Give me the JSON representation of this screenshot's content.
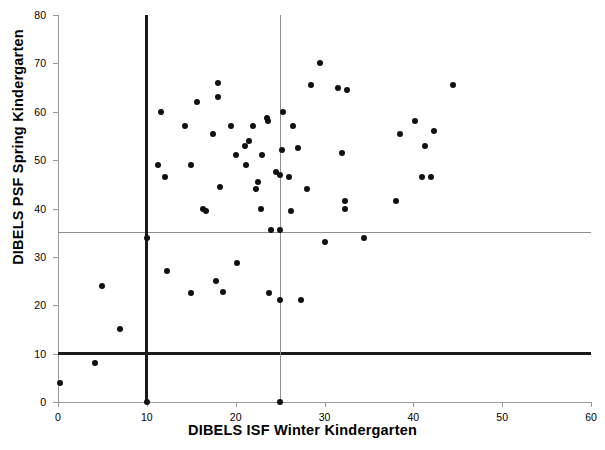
{
  "chart_data": {
    "type": "scatter",
    "title": "",
    "xlabel": "DIBELS ISF Winter Kindergarten",
    "ylabel": "DIBELS PSF Spring Kindergarten",
    "xlim": [
      0,
      60
    ],
    "ylim": [
      0,
      80
    ],
    "xticks": [
      0,
      10,
      20,
      30,
      40,
      50,
      60
    ],
    "yticks": [
      0,
      10,
      20,
      30,
      40,
      50,
      60,
      70,
      80
    ],
    "grid": false,
    "legend": null,
    "reference_lines": [
      {
        "name": "psf-benchmark-10",
        "orientation": "horizontal",
        "value": 10,
        "style": "bold",
        "color": "#1a1a1a"
      },
      {
        "name": "psf-benchmark-35",
        "orientation": "horizontal",
        "value": 35,
        "style": "thin",
        "color": "#8f8f8f"
      },
      {
        "name": "isf-benchmark-10",
        "orientation": "vertical",
        "value": 10,
        "style": "bold",
        "color": "#1a1a1a"
      },
      {
        "name": "isf-benchmark-25",
        "orientation": "vertical",
        "value": 25,
        "style": "thin",
        "color": "#8f8f8f"
      }
    ],
    "marker": {
      "shape": "circle",
      "color": "#111111",
      "size": 6
    },
    "points": [
      [
        0.2,
        4
      ],
      [
        4.2,
        8
      ],
      [
        5.0,
        24
      ],
      [
        7.0,
        15
      ],
      [
        10.0,
        0
      ],
      [
        10.0,
        34
      ],
      [
        11.3,
        49
      ],
      [
        11.6,
        60
      ],
      [
        12.0,
        46.5
      ],
      [
        12.3,
        27
      ],
      [
        14.3,
        57
      ],
      [
        15.0,
        49
      ],
      [
        15.0,
        22.5
      ],
      [
        15.6,
        62
      ],
      [
        16.3,
        40
      ],
      [
        16.7,
        39.5
      ],
      [
        17.5,
        55.5
      ],
      [
        17.8,
        25
      ],
      [
        18.0,
        66
      ],
      [
        18.0,
        63
      ],
      [
        18.2,
        44.5
      ],
      [
        18.6,
        22.8
      ],
      [
        19.5,
        57
      ],
      [
        20.0,
        51
      ],
      [
        20.2,
        28.8
      ],
      [
        21.0,
        53
      ],
      [
        21.2,
        49
      ],
      [
        21.5,
        54
      ],
      [
        22.0,
        57
      ],
      [
        22.3,
        44
      ],
      [
        22.5,
        45.5
      ],
      [
        22.8,
        39.8
      ],
      [
        23.0,
        51
      ],
      [
        23.5,
        58.8
      ],
      [
        23.6,
        58
      ],
      [
        23.8,
        22.5
      ],
      [
        24.0,
        35.5
      ],
      [
        24.5,
        47.5
      ],
      [
        25.0,
        0
      ],
      [
        25.0,
        21
      ],
      [
        25.0,
        35.5
      ],
      [
        25.0,
        47
      ],
      [
        25.2,
        52
      ],
      [
        25.3,
        60
      ],
      [
        26.0,
        46.5
      ],
      [
        26.2,
        39.5
      ],
      [
        26.5,
        57
      ],
      [
        27.0,
        52.5
      ],
      [
        27.3,
        21
      ],
      [
        28.0,
        44
      ],
      [
        28.5,
        65.5
      ],
      [
        29.5,
        70
      ],
      [
        30.0,
        33
      ],
      [
        31.5,
        65
      ],
      [
        32.0,
        51.5
      ],
      [
        32.3,
        41.5
      ],
      [
        32.3,
        40
      ],
      [
        32.5,
        64.5
      ],
      [
        34.5,
        33.8
      ],
      [
        38.0,
        41.5
      ],
      [
        38.5,
        55.5
      ],
      [
        40.2,
        58
      ],
      [
        41.0,
        46.5
      ],
      [
        41.3,
        53
      ],
      [
        42.0,
        46.5
      ],
      [
        42.3,
        56
      ],
      [
        44.5,
        65.5
      ]
    ],
    "n_points": 67
  },
  "axis": {
    "x_title": "DIBELS ISF Winter Kindergarten",
    "y_title": "DIBELS PSF Spring Kindergarten",
    "x_tick_labels": [
      "0",
      "10",
      "20",
      "30",
      "40",
      "50",
      "60"
    ],
    "y_tick_labels": [
      "0",
      "10",
      "20",
      "30",
      "40",
      "50",
      "60",
      "70",
      "80"
    ]
  }
}
